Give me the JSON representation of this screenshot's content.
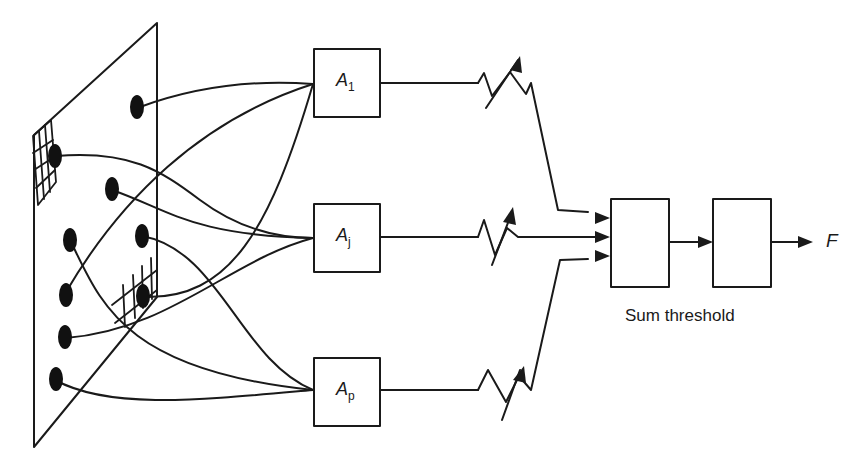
{
  "diagram": {
    "association_units": [
      {
        "name": "A",
        "sub": "1"
      },
      {
        "name": "A",
        "sub": "j"
      },
      {
        "name": "A",
        "sub": "p"
      }
    ],
    "weights": [
      "variable-resistor-1",
      "variable-resistor-j",
      "variable-resistor-p"
    ],
    "sum_threshold_caption": "Sum threshold",
    "output_label": "F",
    "retina": {
      "sensor_points": 9,
      "grids": 2
    },
    "colors": {
      "stroke": "#1a1a1a",
      "background": "#ffffff"
    }
  }
}
